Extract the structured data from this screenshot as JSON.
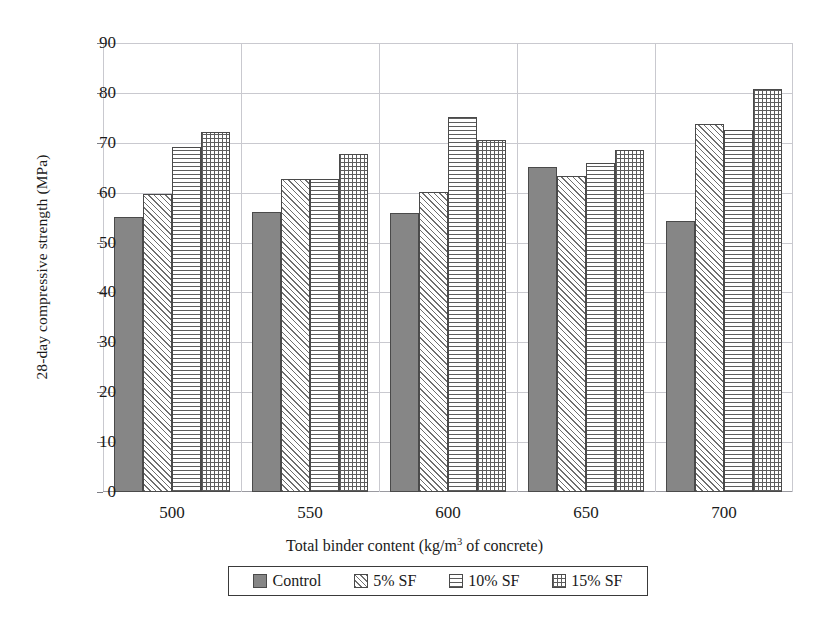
{
  "chart_data": {
    "type": "bar",
    "title": "",
    "xlabel": "Total binder content (kg/m3 of concrete)",
    "xlabel_parts": {
      "prefix": "Total binder content (kg/m",
      "superscript": "3",
      "suffix": " of concrete)"
    },
    "ylabel": "28-day compressive strength (MPa)",
    "categories": [
      "500",
      "550",
      "600",
      "650",
      "700"
    ],
    "ylim": [
      0,
      90
    ],
    "ytick_labels": [
      "0",
      "10",
      "20",
      "30",
      "40",
      "50",
      "60",
      "70",
      "80",
      "90"
    ],
    "ytick_values": [
      0,
      10,
      20,
      30,
      40,
      50,
      60,
      70,
      80,
      90
    ],
    "grid": true,
    "legend_position": "bottom",
    "series": [
      {
        "name": "Control",
        "pattern": "solid-gray",
        "color": "#868686",
        "values": [
          55.1,
          56.2,
          56.0,
          65.1,
          54.3
        ]
      },
      {
        "name": "5% SF",
        "pattern": "diagonal-hatch",
        "color": "#6f6f6f",
        "values": [
          59.7,
          62.8,
          60.1,
          63.4,
          73.7
        ]
      },
      {
        "name": "10% SF",
        "pattern": "horizontal-lines",
        "color": "#5d5d5d",
        "values": [
          69.2,
          62.8,
          75.1,
          66.0,
          72.6
        ]
      },
      {
        "name": "15% SF",
        "pattern": "cross-hatch-grid",
        "color": "#5d5d5d",
        "values": [
          72.2,
          67.7,
          70.6,
          68.6,
          80.8
        ]
      }
    ]
  }
}
